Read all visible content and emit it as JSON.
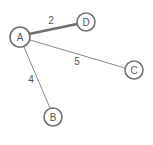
{
  "graph": {
    "nodes": [
      {
        "id": "A",
        "label": "A",
        "x": 20,
        "y": 37,
        "r": 10
      },
      {
        "id": "D",
        "label": "D",
        "x": 86,
        "y": 22,
        "r": 9
      },
      {
        "id": "C",
        "label": "C",
        "x": 134,
        "y": 70,
        "r": 9
      },
      {
        "id": "B",
        "label": "B",
        "x": 53,
        "y": 117,
        "r": 9
      }
    ],
    "edges": [
      {
        "from": "A",
        "to": "D",
        "weight": "2",
        "highlighted": true,
        "label_x": 51,
        "label_y": 20
      },
      {
        "from": "A",
        "to": "C",
        "weight": "5",
        "highlighted": false,
        "label_x": 77,
        "label_y": 61
      },
      {
        "from": "A",
        "to": "B",
        "weight": "4",
        "highlighted": false,
        "label_x": 31,
        "label_y": 78
      }
    ],
    "colors": {
      "highlighted_edge": "#6e6e6e",
      "normal_edge": "#8a8a8a",
      "node_stroke": "#707070",
      "text": "#555555"
    }
  }
}
